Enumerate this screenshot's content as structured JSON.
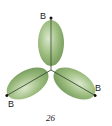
{
  "diagram": {
    "type": "trigonal-planar-orbital-lobes",
    "center": {
      "x": 51,
      "y": 70
    },
    "lobe_color": "#7aa05a",
    "lobe_highlight": "#c9dcb6",
    "atoms": [
      {
        "label": "B",
        "position": "top"
      },
      {
        "label": "B",
        "position": "bottom-left"
      },
      {
        "label": "B",
        "position": "bottom-right"
      }
    ],
    "caption": "26"
  }
}
